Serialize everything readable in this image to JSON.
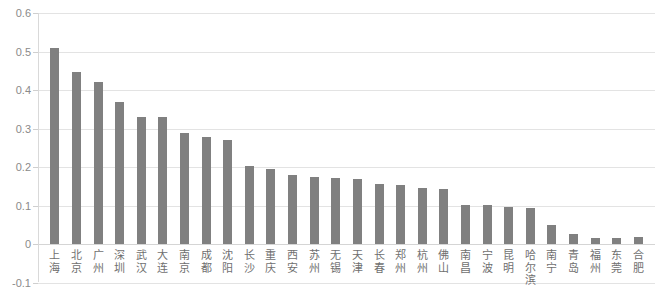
{
  "chart_data": {
    "type": "bar",
    "title": "",
    "subtitle": "",
    "xlabel": "",
    "ylabel": "",
    "ylim": [
      -0.1,
      0.6
    ],
    "ytick_labels": [
      "0.6",
      "0.5",
      "0.4",
      "0.3",
      "0.2",
      "0.1",
      "0",
      "-0.1"
    ],
    "yticks": [
      0.6,
      0.5,
      0.4,
      0.3,
      0.2,
      0.1,
      0,
      -0.1
    ],
    "grid": true,
    "legend": false,
    "legend_position": "none",
    "orientation": "vertical",
    "bar_color": "#808080",
    "grid_color": "#e3e3e3",
    "axis_label_color": "#8a8a8a",
    "categories": [
      "上海",
      "北京",
      "广州",
      "深圳",
      "武汉",
      "大连",
      "南京",
      "成都",
      "沈阳",
      "长沙",
      "重庆",
      "西安",
      "苏州",
      "无锡",
      "天津",
      "长春",
      "郑州",
      "杭州",
      "佛山",
      "南昌",
      "宁波",
      "昆明",
      "哈尔滨",
      "南宁",
      "青岛",
      "福州",
      "东莞",
      "合肥"
    ],
    "values": [
      0.51,
      0.448,
      0.42,
      0.37,
      0.33,
      0.33,
      0.288,
      0.277,
      0.269,
      0.203,
      0.195,
      0.18,
      0.174,
      0.172,
      0.168,
      0.155,
      0.152,
      0.145,
      0.142,
      0.102,
      0.102,
      0.095,
      0.093,
      0.05,
      0.025,
      0.016,
      0.016,
      0.017
    ]
  }
}
